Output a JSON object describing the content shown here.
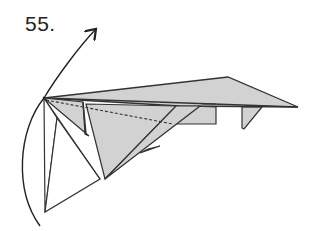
{
  "diagram": {
    "step_label": "55.",
    "colors": {
      "paper_fill": "#d2d2d2",
      "line": "#333333",
      "background": "#ffffff"
    },
    "elements": [
      {
        "name": "rotate-arrow",
        "type": "curved-arrow",
        "direction": "up-right"
      },
      {
        "name": "wing-top-layer",
        "type": "shaded-polygon"
      },
      {
        "name": "main-gray-flap",
        "type": "shaded-polygon"
      },
      {
        "name": "inner-flap",
        "type": "shaded-polygon"
      },
      {
        "name": "white-flap-lower-left",
        "type": "outline-polygon"
      },
      {
        "name": "dashed-crease-line",
        "type": "dashed-line"
      },
      {
        "name": "right-hanging-tab",
        "type": "shaded-polygon"
      },
      {
        "name": "middle-tab",
        "type": "shaded-polygon"
      },
      {
        "name": "small-point-tab",
        "type": "shaded-polygon"
      }
    ]
  }
}
